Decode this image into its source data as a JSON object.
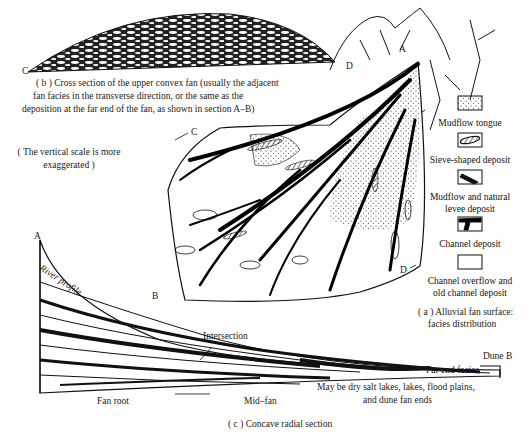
{
  "figure": {
    "panel_b": {
      "caption_line1": "( b ) Cross section of the upper convex fan (usually the adjacent",
      "caption_line2": "fan facies in the transverse direction, or the same as the",
      "caption_line3": "deposition at the far end of the fan, as shown in section A–B)",
      "point_left": "C",
      "point_right": "D"
    },
    "scale_note": {
      "line1": "( The vertical scale is more",
      "line2": "exaggerated )"
    },
    "panel_a": {
      "point_a": "A",
      "point_b": "B",
      "point_c": "C",
      "point_d": "D",
      "caption_line1": "( a )  Alluvial fan surface:",
      "caption_line2": "facies distribution"
    },
    "legend": [
      {
        "label": "Mudflow tongue",
        "pattern": "stippled"
      },
      {
        "label": "Sieve-shaped deposit",
        "pattern": "hatched-lens"
      },
      {
        "label_line1": "Mudflow and natural",
        "label_line2": "levee deposit",
        "pattern": "diagonal-fill"
      },
      {
        "label": "Channel deposit",
        "pattern": "black-channel"
      },
      {
        "label_line1": "Channel overflow and",
        "label_line2": "old channel deposit",
        "pattern": "blank"
      }
    ],
    "panel_c": {
      "point_a": "A",
      "river_profile": "River profile",
      "intersection": "Intersection",
      "dune_b": "Dune B",
      "far_end_facies": "Far end facies",
      "note_line1": "May be dry salt lakes, lakes, flood plains,",
      "note_line2": "and dune fan ends",
      "fan_root": "Fan root",
      "mid_fan": "Mid–fan",
      "caption": "( c ) Concave radial section"
    }
  }
}
